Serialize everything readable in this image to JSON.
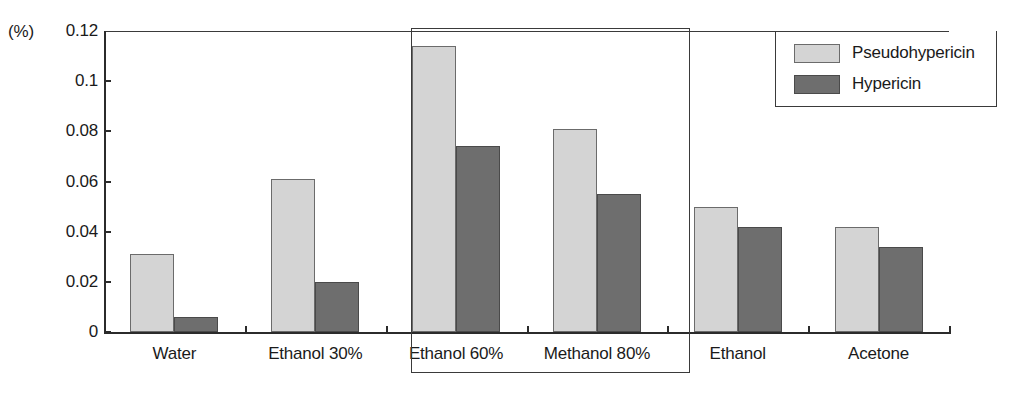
{
  "chart_data": {
    "type": "bar",
    "title": "",
    "subtitle": "",
    "xlabel": "",
    "ylabel": "",
    "unit_label": "(%)",
    "categories": [
      "Water",
      "Ethanol 30%",
      "Ethanol 60%",
      "Methanol 80%",
      "Ethanol",
      "Acetone"
    ],
    "series": [
      {
        "name": "Pseudohypericin",
        "color": "#d4d4d4",
        "values": [
          0.031,
          0.061,
          0.114,
          0.081,
          0.05,
          0.042
        ]
      },
      {
        "name": "Hypericin",
        "color": "#6e6e6e",
        "values": [
          0.006,
          0.02,
          0.074,
          0.055,
          0.042,
          0.034
        ]
      }
    ],
    "ylim": [
      0,
      0.12
    ],
    "yticks": [
      0,
      0.02,
      0.04,
      0.06,
      0.08,
      0.1,
      0.12
    ],
    "ytick_labels": [
      "0",
      "0.02",
      "0.04",
      "0.06",
      "0.08",
      "0.1",
      "0.12"
    ],
    "grid": false,
    "legend_position": "top-right",
    "annotations": [
      {
        "kind": "highlight-box",
        "categories": [
          "Ethanol 60%",
          "Methanol 80%"
        ]
      }
    ]
  },
  "legend": {
    "items": [
      {
        "label": "Pseudohypericin"
      },
      {
        "label": "Hypericin"
      }
    ]
  },
  "colors": {
    "series_light": "#d4d4d4",
    "series_dark": "#6e6e6e",
    "axis": "#2b2b2b",
    "background": "#ffffff"
  }
}
